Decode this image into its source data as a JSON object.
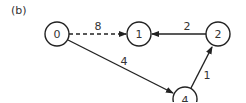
{
  "panel_label": "(b)",
  "nodes": [
    {
      "id": "0",
      "label": "0",
      "cx": 57,
      "cy": 34
    },
    {
      "id": "1",
      "label": "1",
      "cx": 139,
      "cy": 34
    },
    {
      "id": "2",
      "label": "2",
      "cx": 218,
      "cy": 34
    },
    {
      "id": "4",
      "label": "4",
      "cx": 185,
      "cy": 99
    }
  ],
  "edges": [
    {
      "from": "0",
      "to": "1",
      "weight": "8",
      "style": "dashed"
    },
    {
      "from": "2",
      "to": "1",
      "weight": "2",
      "style": "solid"
    },
    {
      "from": "0",
      "to": "4",
      "weight": "4",
      "style": "solid"
    },
    {
      "from": "4",
      "to": "2",
      "weight": "1",
      "style": "solid"
    }
  ],
  "colors": {
    "stroke": "#222222",
    "text": "#333333",
    "background": "#ffffff"
  }
}
